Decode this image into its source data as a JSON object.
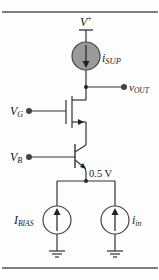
{
  "diagram": {
    "type": "circuit-schematic",
    "supply": {
      "label": "V",
      "superscript": "+"
    },
    "supply_current_source": {
      "label": "i",
      "subscript": "SUP",
      "fill": "#9a9a9a"
    },
    "output": {
      "label": "v",
      "subscript": "OUT"
    },
    "mosfet_gate": {
      "label": "V",
      "subscript": "G"
    },
    "bjt_base": {
      "label": "V",
      "subscript": "B"
    },
    "emitter_node": {
      "label": "0.5 V"
    },
    "bias_source": {
      "label": "I",
      "subscript": "BIAS"
    },
    "input_source": {
      "label": "i",
      "subscript": "in"
    },
    "colors": {
      "wire": "#333333",
      "rule": "#555555",
      "source_fill": "#9a9a9a",
      "background": "#fdfdfd"
    }
  }
}
